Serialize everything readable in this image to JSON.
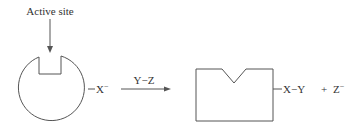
{
  "diagram": {
    "type": "enzyme-substrate reaction schematic",
    "labels": {
      "active_site": "Active site",
      "reactant_ligand": "X",
      "reactant_charge": "−",
      "reagent": "Y−Z",
      "product_ligand": "X−Y",
      "plus": "+",
      "byproduct": "Z",
      "byproduct_charge": "−"
    },
    "colors": {
      "stroke": "#555555",
      "text": "#333333",
      "background": "#ffffff"
    }
  }
}
